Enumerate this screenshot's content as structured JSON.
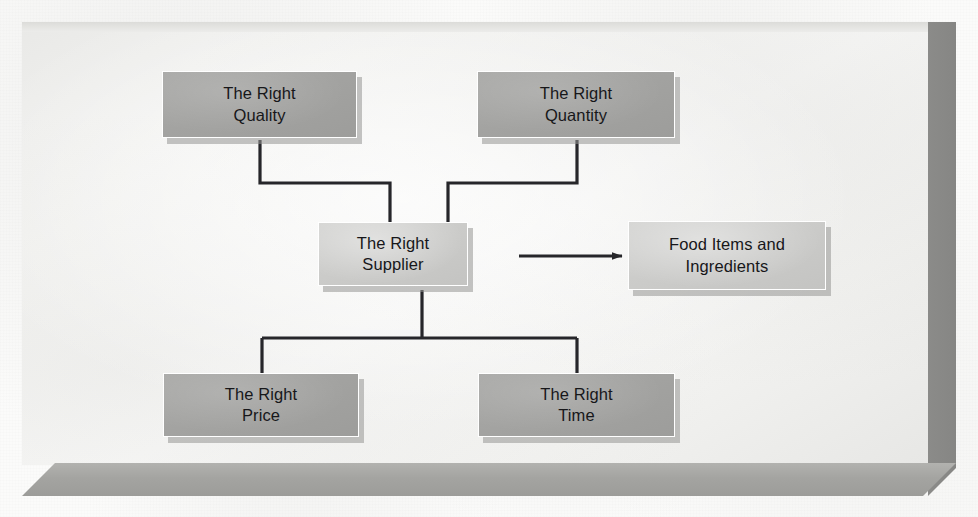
{
  "figure": {
    "kind": "block-flow-diagram",
    "caption": "",
    "frame": {
      "style": "3d-beveled-panel",
      "face_color": "#f4f4f2",
      "right_bevel_color": "#8c8c8a",
      "bottom_bevel_color": "#a4a4a1"
    },
    "colors": {
      "box_dark": "#a3a3a1",
      "box_light": "#cbcbc9",
      "box_border": "#ffffff",
      "box_shadow": "#969694",
      "connector": "#26262a",
      "text": "#17171a"
    }
  },
  "nodes": [
    {
      "id": "right-quality",
      "label": "The Right\nQuality",
      "line1": "The Right",
      "line2": "Quality",
      "shade": "dark",
      "x": 162,
      "y": 71,
      "w": 195,
      "h": 67
    },
    {
      "id": "right-quantity",
      "label": "The Right\nQuantity",
      "line1": "The Right",
      "line2": "Quantity",
      "shade": "dark",
      "x": 477,
      "y": 71,
      "w": 198,
      "h": 67
    },
    {
      "id": "right-supplier",
      "label": "The Right\nSupplier",
      "line1": "The Right",
      "line2": "Supplier",
      "shade": "light",
      "x": 318,
      "y": 222,
      "w": 150,
      "h": 64
    },
    {
      "id": "food-items-and-ingredients",
      "label": "Food Items and\nIngredients",
      "line1": "Food Items and",
      "line2": "Ingredients",
      "shade": "light",
      "x": 628,
      "y": 221,
      "w": 198,
      "h": 69
    },
    {
      "id": "right-price",
      "label": "The Right\nPrice",
      "line1": "The Right",
      "line2": "Price",
      "shade": "dark",
      "x": 163,
      "y": 373,
      "w": 196,
      "h": 64
    },
    {
      "id": "right-time",
      "label": "The Right\nTime",
      "line1": "The Right",
      "line2": "Time",
      "shade": "dark",
      "x": 478,
      "y": 373,
      "w": 197,
      "h": 64
    }
  ],
  "edges": [
    {
      "id": "quality-to-supplier",
      "from": "right-quality",
      "to": "right-supplier",
      "style": "orthogonal",
      "arrow": false
    },
    {
      "id": "quantity-to-supplier",
      "from": "right-quantity",
      "to": "right-supplier",
      "style": "orthogonal",
      "arrow": false
    },
    {
      "id": "supplier-to-price",
      "from": "right-supplier",
      "to": "right-price",
      "style": "orthogonal",
      "arrow": false
    },
    {
      "id": "supplier-to-time",
      "from": "right-supplier",
      "to": "right-time",
      "style": "orthogonal",
      "arrow": false
    },
    {
      "id": "supplier-to-food-items",
      "from": "right-supplier",
      "to": "food-items-and-ingredients",
      "style": "straight",
      "arrow": true
    }
  ]
}
